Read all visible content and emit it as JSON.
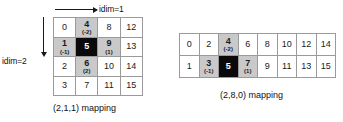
{
  "diagram": {
    "axes": {
      "horizontal": {
        "label": "idim=1",
        "icon": "arrow-right-icon"
      },
      "vertical": {
        "label": "idim=2",
        "icon": "arrow-down-icon"
      }
    },
    "left_grid": {
      "caption": "(2,1,1) mapping",
      "rows": 4,
      "cols": 4,
      "cells": [
        {
          "value": "0",
          "offset": "",
          "style": "plain"
        },
        {
          "value": "4",
          "offset": "(-2)",
          "style": "shaded"
        },
        {
          "value": "8",
          "offset": "",
          "style": "plain"
        },
        {
          "value": "12",
          "offset": "",
          "style": "plain"
        },
        {
          "value": "1",
          "offset": "(-1)",
          "style": "shaded"
        },
        {
          "value": "5",
          "offset": "",
          "style": "center"
        },
        {
          "value": "9",
          "offset": "(1)",
          "style": "shaded"
        },
        {
          "value": "13",
          "offset": "",
          "style": "plain"
        },
        {
          "value": "2",
          "offset": "",
          "style": "plain"
        },
        {
          "value": "6",
          "offset": "(2)",
          "style": "shaded"
        },
        {
          "value": "10",
          "offset": "",
          "style": "plain"
        },
        {
          "value": "14",
          "offset": "",
          "style": "plain"
        },
        {
          "value": "3",
          "offset": "",
          "style": "plain"
        },
        {
          "value": "7",
          "offset": "",
          "style": "plain"
        },
        {
          "value": "11",
          "offset": "",
          "style": "plain"
        },
        {
          "value": "15",
          "offset": "",
          "style": "plain"
        }
      ]
    },
    "right_grid": {
      "caption": "(2,8,0) mapping",
      "rows": 2,
      "cols": 8,
      "cells": [
        {
          "value": "0",
          "offset": "",
          "style": "plain"
        },
        {
          "value": "2",
          "offset": "",
          "style": "plain"
        },
        {
          "value": "4",
          "offset": "(-2)",
          "style": "shaded"
        },
        {
          "value": "6",
          "offset": "",
          "style": "plain"
        },
        {
          "value": "8",
          "offset": "",
          "style": "plain"
        },
        {
          "value": "10",
          "offset": "",
          "style": "plain"
        },
        {
          "value": "12",
          "offset": "",
          "style": "plain"
        },
        {
          "value": "14",
          "offset": "",
          "style": "plain"
        },
        {
          "value": "1",
          "offset": "",
          "style": "plain"
        },
        {
          "value": "3",
          "offset": "(-1)",
          "style": "shaded"
        },
        {
          "value": "5",
          "offset": "",
          "style": "center"
        },
        {
          "value": "7",
          "offset": "(1)",
          "style": "shaded"
        },
        {
          "value": "9",
          "offset": "",
          "style": "plain"
        },
        {
          "value": "11",
          "offset": "",
          "style": "plain"
        },
        {
          "value": "13",
          "offset": "",
          "style": "plain"
        },
        {
          "value": "15",
          "offset": "",
          "style": "plain"
        }
      ]
    },
    "colors": {
      "shaded": "#c9c9c9",
      "center": "#0a0a0a",
      "border": "#9a9a9a",
      "text": "#1a1a1a"
    }
  }
}
